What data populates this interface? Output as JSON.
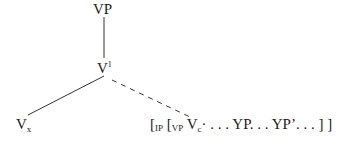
{
  "tree": {
    "root": "VP",
    "intermediate": {
      "base": "V",
      "superscript": "1"
    },
    "left_leaf": {
      "base": "V",
      "subscript": "x"
    },
    "right_leaf": {
      "open1": "[",
      "ip_sub": "IP",
      "open2": "[",
      "vp_sub": "VP",
      "v": "V",
      "v_sub": "c",
      "rest": "· . . . YP. . . YP’. . . ] ]"
    }
  }
}
